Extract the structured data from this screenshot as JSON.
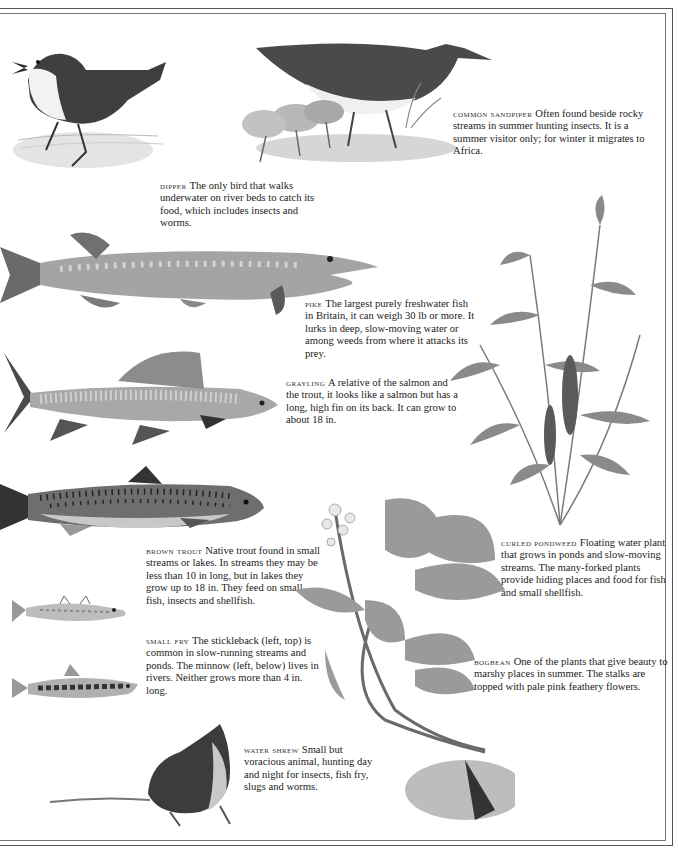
{
  "page": {
    "colors": {
      "background": "#ffffff",
      "text": "#222222",
      "border": "#555555",
      "ink_dark": "#3a3a3a",
      "ink_mid": "#8a8a8a",
      "ink_light": "#c8c8c8"
    }
  },
  "entries": [
    {
      "id": "dipper",
      "name": "DIPPER",
      "text": "The only bird that walks underwater on river beds to catch its food, which includes insects and worms.",
      "illustration": "dipper-bird-icon"
    },
    {
      "id": "common-sandpiper",
      "name": "COMMON SANDPIPER",
      "text": "Often found beside rocky streams in summer hunting insects. It is a summer visitor only; for winter it migrates to Africa.",
      "illustration": "sandpiper-bird-icon"
    },
    {
      "id": "pike",
      "name": "PIKE",
      "text": "The largest purely freshwater fish in Britain, it can weigh 30 lb or more. It lurks in deep, slow-moving water or among weeds from where it attacks its prey.",
      "illustration": "pike-fish-icon"
    },
    {
      "id": "grayling",
      "name": "GRAYLING",
      "text": "A relative of the salmon and the trout, it looks like a salmon but has a long, high fin on its back. It can grow to about 18 in.",
      "illustration": "grayling-fish-icon"
    },
    {
      "id": "brown-trout",
      "name": "BROWN TROUT",
      "text": "Native trout found in small streams or lakes. In streams they may be less than 10 in long, but in lakes they grow up to 18 in. They feed on small fish, insects and shellfish.",
      "illustration": "trout-fish-icon"
    },
    {
      "id": "small-fry",
      "name": "SMALL FRY",
      "text": "The stickleback (left, top) is common in slow-running streams and ponds. The minnow (left, below) lives in rivers. Neither grows more than 4 in. long.",
      "illustration": "stickleback-minnow-icon"
    },
    {
      "id": "water-shrew",
      "name": "WATER SHREW",
      "text": "Small but voracious animal, hunting day and night for insects, fish fry, slugs and worms.",
      "illustration": "shrew-icon"
    },
    {
      "id": "curled-pondweed",
      "name": "CURLED PONDWEED",
      "text": "Floating water plant that grows in ponds and slow-moving streams. The many-forked plants provide hiding places and food for fish and small shellfish.",
      "illustration": "pondweed-plant-icon"
    },
    {
      "id": "bogbean",
      "name": "BOGBEAN",
      "text": "One of the plants that give beauty to marshy places in summer. The stalks are topped with pale pink feathery flowers.",
      "illustration": "bogbean-plant-icon"
    }
  ]
}
